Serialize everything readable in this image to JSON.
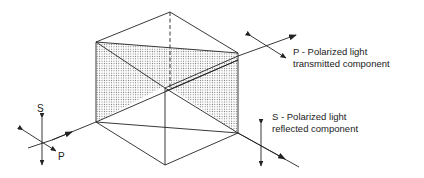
{
  "diagram": {
    "type": "polarizing-beamsplitter-cube",
    "labels": {
      "transmitted": {
        "line1": "P - Polarized light",
        "line2": "transmitted component"
      },
      "reflected": {
        "line1": "S - Polarized light",
        "line2": "reflected component"
      },
      "input_s": "S",
      "input_p": "P"
    },
    "colors": {
      "stroke": "#222222",
      "shading_dot": "#555555",
      "background": "#ffffff"
    }
  }
}
